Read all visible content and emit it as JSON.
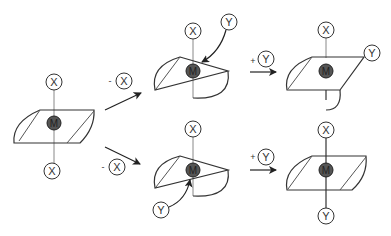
{
  "diagram": {
    "title": "",
    "colors": {
      "stroke": "#333333",
      "thin_stroke": "#888888",
      "m_fill": "#555555",
      "background": "#ffffff"
    },
    "initial": {
      "top_node": "X",
      "center_node": "M",
      "bottom_node": "X"
    },
    "transitions": [
      {
        "id": "top",
        "operator": "-",
        "ligand": "X"
      },
      {
        "id": "bottom",
        "operator": "-",
        "ligand": "X"
      },
      {
        "id": "top-right",
        "operator": "+",
        "ligand": "Y"
      },
      {
        "id": "bottom-right",
        "operator": "+",
        "ligand": "Y"
      }
    ],
    "intermediate_top": {
      "top_node": "X",
      "incoming_node": "Y",
      "center_node": "M"
    },
    "intermediate_bottom": {
      "top_node": "X",
      "incoming_node": "Y",
      "center_node": "M"
    },
    "final_top": {
      "top_node": "X",
      "side_node": "Y",
      "center_node": "M"
    },
    "final_bottom": {
      "top_node": "X",
      "bottom_node": "Y",
      "center_node": "M"
    }
  }
}
